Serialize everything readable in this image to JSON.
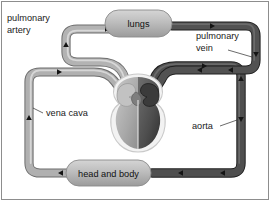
{
  "diagram": {
    "background_color": "#ffffff",
    "frame_color": "#8d8d8d",
    "nodes": [
      {
        "id": "lungs",
        "label": "lungs",
        "x": 135,
        "y": 22
      },
      {
        "id": "head_and_body",
        "label": "head and body",
        "x": 115,
        "y": 173
      }
    ],
    "vessel_labels": [
      {
        "id": "pulmonary_artery",
        "line1": "pulmonary",
        "line2": "artery",
        "x": 6,
        "y": 24
      },
      {
        "id": "pulmonary_vein",
        "line1": "pulmonary",
        "line2": "vein",
        "x": 196,
        "y": 32
      },
      {
        "id": "vena_cava",
        "line1": "vena cava",
        "line2": "",
        "x": 46,
        "y": 113
      },
      {
        "id": "aorta",
        "line1": "aorta",
        "line2": "",
        "x": 192,
        "y": 126
      }
    ],
    "colors": {
      "deoxygenated_vessel": "#9c9c9c",
      "deoxygenated_vessel_dark": "#7a7a7a",
      "oxygenated_vessel": "#4a4a4a",
      "oxygenated_vessel_dark": "#2e2e2e",
      "node_fill": "#b0b0b0",
      "heart_left": "#b4b4b4",
      "heart_right": "#585858",
      "heart_outline": "#cfcfcf",
      "text": "#1a1a1a",
      "arrow": "#1c1c1c"
    },
    "flow_arrows": [
      {
        "id": "arrow-pa-up",
        "vessel": "pulmonary_artery",
        "direction": "up"
      },
      {
        "id": "arrow-pa-right",
        "vessel": "pulmonary_artery",
        "direction": "right"
      },
      {
        "id": "arrow-pv-right",
        "vessel": "pulmonary_vein",
        "direction": "right"
      },
      {
        "id": "arrow-pv-down",
        "vessel": "pulmonary_vein",
        "direction": "down"
      },
      {
        "id": "arrow-pv-left",
        "vessel": "pulmonary_vein",
        "direction": "left"
      },
      {
        "id": "arrow-vc-right-top",
        "vessel": "vena_cava",
        "direction": "right"
      },
      {
        "id": "arrow-vc-up",
        "vessel": "vena_cava",
        "direction": "up"
      },
      {
        "id": "arrow-vc-left-bottom",
        "vessel": "vena_cava",
        "direction": "left"
      },
      {
        "id": "arrow-ao-up",
        "vessel": "aorta",
        "direction": "up"
      },
      {
        "id": "arrow-ao-right",
        "vessel": "aorta",
        "direction": "right"
      },
      {
        "id": "arrow-ao-down",
        "vessel": "aorta",
        "direction": "down"
      },
      {
        "id": "arrow-ao-left",
        "vessel": "aorta",
        "direction": "left"
      }
    ]
  }
}
